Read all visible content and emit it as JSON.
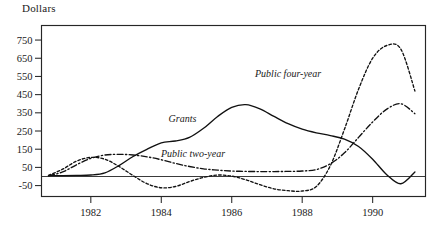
{
  "axis_title": "Dollars",
  "chart_data": {
    "type": "line",
    "title": "",
    "subtitle": "",
    "xlabel": "",
    "ylabel": "Dollars",
    "grid": false,
    "legend_position": "inline-annotations",
    "xlim": [
      1980.6,
      1991.5
    ],
    "ylim": [
      -110,
      830
    ],
    "ytick_labels": [
      "750",
      "650",
      "550",
      "450",
      "350",
      "250",
      "150",
      "50",
      "-50"
    ],
    "ytick_values": [
      750,
      650,
      550,
      450,
      350,
      250,
      150,
      50,
      -50
    ],
    "xtick_labels": [
      "1982",
      "1984",
      "1986",
      "1988",
      "1990"
    ],
    "xtick_values": [
      1982,
      1984,
      1986,
      1988,
      1990
    ],
    "zero_reference_line": 0,
    "annotations": [
      {
        "text": "Grants",
        "x": 1984.6,
        "y": 300
      },
      {
        "text": "Public two-year",
        "x": 1984.9,
        "y": 105
      },
      {
        "text": "Public four-year",
        "x": 1987.6,
        "y": 545
      }
    ],
    "series": [
      {
        "name": "Grants",
        "style": "solid",
        "x": [
          1980.8,
          1981.2,
          1981.6,
          1982.0,
          1982.4,
          1982.8,
          1983.2,
          1983.6,
          1984.0,
          1984.4,
          1984.8,
          1985.2,
          1985.6,
          1986.0,
          1986.4,
          1986.8,
          1987.2,
          1987.6,
          1988.0,
          1988.4,
          1988.8,
          1989.2,
          1989.6,
          1990.0,
          1990.4,
          1990.8,
          1991.2
        ],
        "values": [
          5,
          5,
          6,
          8,
          20,
          60,
          110,
          150,
          185,
          195,
          215,
          265,
          330,
          380,
          395,
          372,
          330,
          290,
          260,
          240,
          225,
          205,
          165,
          95,
          10,
          -40,
          25
        ]
      },
      {
        "name": "Public two-year",
        "style": "dash-dot",
        "x": [
          1980.8,
          1981.2,
          1981.6,
          1982.0,
          1982.4,
          1982.8,
          1983.2,
          1983.6,
          1984.0,
          1984.4,
          1984.8,
          1985.2,
          1985.6,
          1986.0,
          1986.4,
          1986.8,
          1987.2,
          1987.6,
          1988.0,
          1988.4,
          1988.8,
          1989.2,
          1989.6,
          1990.0,
          1990.4,
          1990.8,
          1991.2
        ],
        "values": [
          4,
          25,
          65,
          100,
          118,
          122,
          118,
          108,
          92,
          72,
          55,
          42,
          35,
          30,
          28,
          27,
          27,
          28,
          30,
          38,
          70,
          130,
          215,
          300,
          370,
          400,
          345
        ]
      },
      {
        "name": "Public four-year",
        "style": "dotted",
        "x": [
          1980.8,
          1981.2,
          1981.6,
          1982.0,
          1982.4,
          1982.8,
          1983.2,
          1983.6,
          1984.0,
          1984.4,
          1984.8,
          1985.2,
          1985.6,
          1986.0,
          1986.4,
          1986.8,
          1987.2,
          1987.6,
          1988.0,
          1988.4,
          1988.8,
          1989.2,
          1989.6,
          1990.0,
          1990.4,
          1990.8,
          1991.2
        ],
        "values": [
          6,
          40,
          85,
          105,
          95,
          55,
          5,
          -40,
          -62,
          -55,
          -28,
          -5,
          8,
          2,
          -18,
          -45,
          -68,
          -78,
          -80,
          -55,
          60,
          260,
          480,
          650,
          720,
          700,
          470
        ]
      }
    ]
  }
}
